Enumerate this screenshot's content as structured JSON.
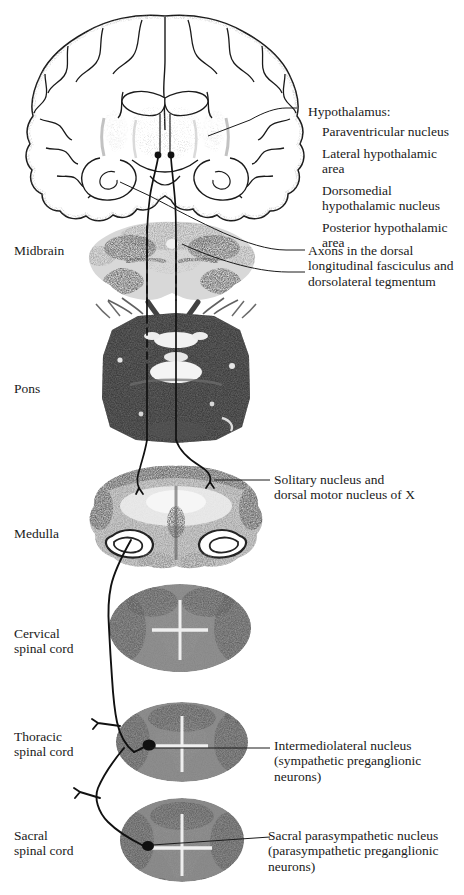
{
  "figure": {
    "type": "neuroanatomy-diagram",
    "background_color": "#ffffff",
    "ink_color": "#1a1a1a"
  },
  "left_labels": [
    {
      "id": "midbrain",
      "text": "Midbrain",
      "x": 14,
      "y": 243
    },
    {
      "id": "pons",
      "text": "Pons",
      "x": 14,
      "y": 381
    },
    {
      "id": "medulla",
      "text": "Medulla",
      "x": 14,
      "y": 526
    },
    {
      "id": "cervical",
      "text": "Cervical\nspinal cord",
      "x": 14,
      "y": 626
    },
    {
      "id": "thoracic",
      "text": "Thoracic\nspinal cord",
      "x": 14,
      "y": 729
    },
    {
      "id": "sacral",
      "text": "Sacral\nspinal cord",
      "x": 14,
      "y": 828
    }
  ],
  "right_labels": {
    "hypothalamus_heading": {
      "text": "Hypothalamus:",
      "x": 308,
      "y": 104
    },
    "hypothalamus_items": [
      {
        "id": "paraventricular",
        "text": "Paraventricular nucleus",
        "x": 322,
        "y": 124
      },
      {
        "id": "lateral",
        "text": "Lateral hypothalamic\narea",
        "x": 322,
        "y": 146
      },
      {
        "id": "dorsomedial",
        "text": "Dorsomedial\nhypothalamic nucleus",
        "x": 322,
        "y": 183
      },
      {
        "id": "posterior",
        "text": "Posterior hypothalamic\narea",
        "x": 322,
        "y": 220
      }
    ],
    "axons": {
      "text": "Axons in the dorsal\nlongitudinal fasciculus and\ndorsolateral tegmentum",
      "x": 308,
      "y": 243
    },
    "solitary": {
      "text": "Solitary nucleus and\ndorsal motor nucleus of X",
      "x": 274,
      "y": 472
    },
    "iml": {
      "text": "Intermediolateral nucleus\n(sympathetic preganglionic\nneurons)",
      "x": 274,
      "y": 738
    },
    "sacral_nucleus": {
      "text": "Sacral parasympathetic nucleus\n(parasympathetic preganglionic\nneurons)",
      "x": 274,
      "y": 828
    }
  },
  "sections": [
    {
      "id": "cerebrum-coronal",
      "label": "coronal forebrain section",
      "cx": 165,
      "cy": 120
    },
    {
      "id": "midbrain-section",
      "label": "midbrain transverse section",
      "cx": 172,
      "cy": 262
    },
    {
      "id": "pons-section",
      "label": "pons transverse section",
      "cx": 176,
      "cy": 378
    },
    {
      "id": "medulla-section",
      "label": "medulla transverse section",
      "cx": 176,
      "cy": 520
    },
    {
      "id": "cervical-section",
      "label": "cervical cord section",
      "cx": 180,
      "cy": 628
    },
    {
      "id": "thoracic-section",
      "label": "thoracic cord section",
      "cx": 182,
      "cy": 742
    },
    {
      "id": "sacral-section",
      "label": "sacral cord section",
      "cx": 182,
      "cy": 840
    }
  ]
}
